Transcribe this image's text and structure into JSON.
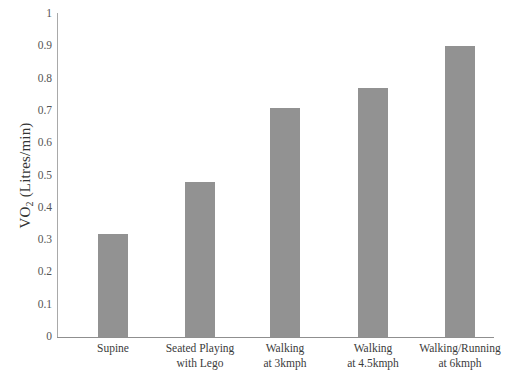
{
  "chart_data": {
    "type": "bar",
    "title": "",
    "xlabel": "",
    "ylabel": "VO2 (Litres/min)",
    "ylabel_main": "VO",
    "ylabel_sub": "2",
    "ylabel_rest": " (Litres/min)",
    "ylim": [
      0,
      1
    ],
    "grid": false,
    "legend": "none",
    "categories": [
      "Supine",
      "Seated Playing with Lego",
      "Walking at 3kmph",
      "Walking at 4.5kmph",
      "Walking/Running at 6kmph"
    ],
    "category_lines": [
      {
        "line1": "Supine",
        "line2": ""
      },
      {
        "line1": "Seated Playing",
        "line2": "with Lego"
      },
      {
        "line1": "Walking",
        "line2": "at 3kmph"
      },
      {
        "line1": "Walking",
        "line2": "at 4.5kmph"
      },
      {
        "line1": "Walking/Running",
        "line2": "at 6kmph"
      }
    ],
    "values": [
      0.32,
      0.48,
      0.71,
      0.77,
      0.9
    ],
    "ytick_labels": [
      "1",
      "0.9",
      "0.8",
      "0.7",
      "0.6",
      "0.5",
      "0.4",
      "0.3",
      "0.2",
      "0.1",
      "0"
    ],
    "ytick_values": [
      1,
      0.9,
      0.8,
      0.7,
      0.6,
      0.5,
      0.4,
      0.3,
      0.2,
      0.1,
      0
    ],
    "bar_color": "#929292",
    "axis_color": "#8f8f8f"
  },
  "annotations": {
    "cropped_title_remnant": ""
  }
}
